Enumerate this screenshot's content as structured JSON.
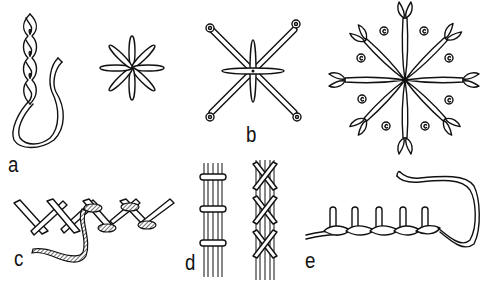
{
  "figure": {
    "labels": {
      "a": "a",
      "b": "b",
      "c": "c",
      "d": "d",
      "e": "e"
    },
    "panels": [
      {
        "id": "a",
        "description": "Chain stitch with thread loop, and lazy-daisy star"
      },
      {
        "id": "b",
        "description": "Star stitch with four long diagonal arms ending in small circles"
      },
      {
        "id": "b2",
        "description": "Eight-arm star with fly-stitch ends and eight small spiral dots"
      },
      {
        "id": "c",
        "description": "Herringbone / cross stitch with wrapped thread"
      },
      {
        "id": "d",
        "description": "Couched bundles: straight bars and crossed bars"
      },
      {
        "id": "e",
        "description": "Blanket / twisted stitch with loop of thread"
      }
    ],
    "colors": {
      "ink": "#111111",
      "background": "#ffffff"
    }
  }
}
